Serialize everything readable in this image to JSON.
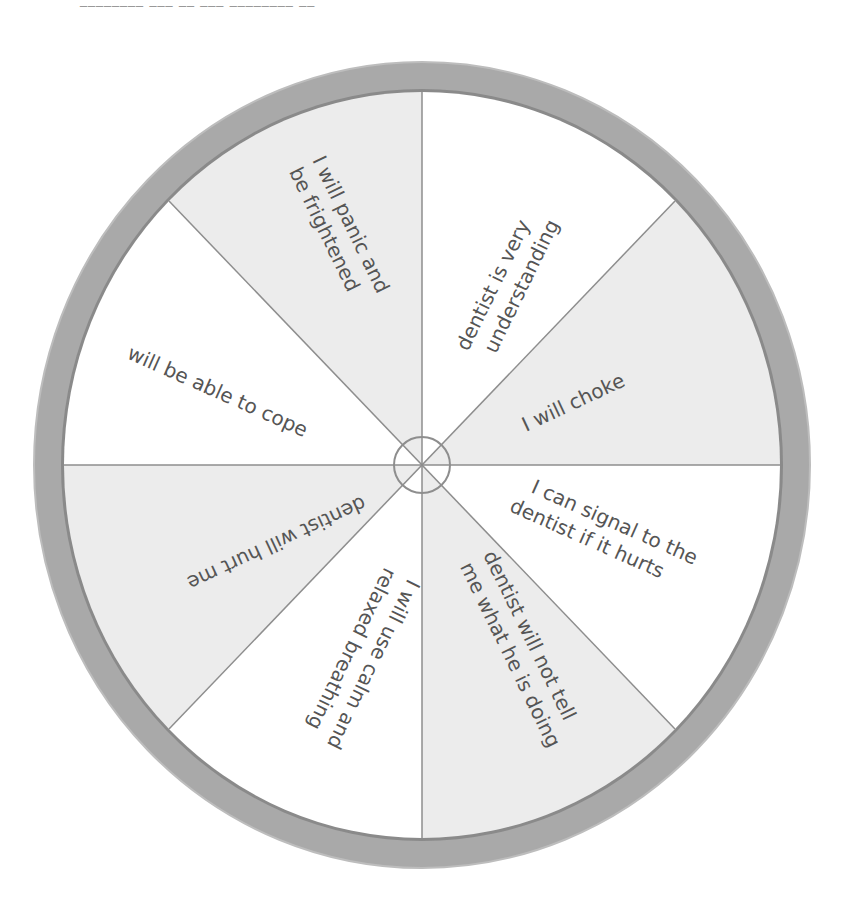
{
  "header": {
    "cutoff_text": "________ ___ __ ___ ________ __"
  },
  "wheel": {
    "center": [
      422,
      465
    ],
    "outer_radius": [
      388,
      403
    ],
    "inner_radius": [
      358,
      373
    ],
    "hub_radius": 28,
    "colors": {
      "rim": "#a9a9a9",
      "rim_edge": "#8a8a8a",
      "shaded": "#ececec",
      "white": "#ffffff",
      "divider": "#8e8e8e",
      "text": "#555555"
    },
    "segments": [
      {
        "id": "panic",
        "shaded": true,
        "lines": [
          "I will panic and",
          "be frightened"
        ]
      },
      {
        "id": "understanding",
        "shaded": false,
        "lines": [
          "dentist is very",
          "understanding"
        ]
      },
      {
        "id": "choke",
        "shaded": true,
        "lines": [
          "I will choke"
        ]
      },
      {
        "id": "signal",
        "shaded": false,
        "lines": [
          "I can signal to the",
          "dentist if it hurts"
        ]
      },
      {
        "id": "not-tell",
        "shaded": true,
        "lines": [
          "dentist will not tell",
          "me what he is doing"
        ]
      },
      {
        "id": "breathing",
        "shaded": false,
        "lines": [
          "I will use calm and",
          "relaxed breathing"
        ]
      },
      {
        "id": "hurt",
        "shaded": true,
        "lines": [
          "dentist will hurt me"
        ]
      },
      {
        "id": "cope",
        "shaded": false,
        "lines": [
          "will be able to cope"
        ]
      }
    ]
  },
  "labels": {
    "panic_1": "I will panic and",
    "panic_2": "be frightened",
    "understanding_1": "dentist is very",
    "understanding_2": "understanding",
    "choke_1": "I will choke",
    "signal_1": "I can signal to the",
    "signal_2": "dentist if it hurts",
    "nottell_1": "dentist will not tell",
    "nottell_2": "me what he is doing",
    "breathing_1": "I will use calm and",
    "breathing_2": "relaxed breathing",
    "hurt_1": "dentist will hurt me",
    "cope_1": "will be able to cope"
  }
}
